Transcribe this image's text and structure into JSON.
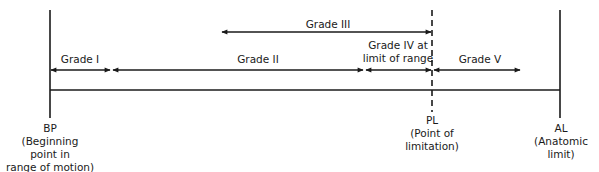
{
  "diagram": {
    "grades": [
      {
        "label": "Grade I"
      },
      {
        "label": "Grade II"
      },
      {
        "label": "Grade III"
      },
      {
        "label_line1": "Grade IV at",
        "label_line2": "limit of range"
      },
      {
        "label": "Grade V"
      }
    ],
    "points": {
      "bp": {
        "abbr": "BP",
        "line1": "(Beginning",
        "line2": "point in",
        "line3": "range of motion)"
      },
      "pl": {
        "abbr": "PL",
        "line1": "(Point of",
        "line2": "limitation)"
      },
      "al": {
        "abbr": "AL",
        "line1": "(Anatomic",
        "line2": "limit)"
      }
    },
    "colors": {
      "ink": "#1a1a1a",
      "background": "#ffffff"
    }
  }
}
